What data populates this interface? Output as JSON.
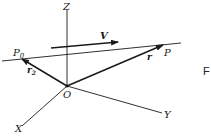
{
  "diagram": {
    "title": "",
    "axes": {
      "z_label": "Z",
      "y_label": "Y",
      "x_label": "X",
      "origin_label": "O"
    },
    "points": {
      "p0_label": "P",
      "p0_subscript": "0",
      "p_label": "P"
    },
    "vectors": {
      "v_label": "V",
      "r_label": "r",
      "r2_label": "r",
      "r2_subscript": "2"
    },
    "edge_text": "F",
    "colors": {
      "line": "#1a1a1a",
      "background": "#ffffff"
    }
  }
}
